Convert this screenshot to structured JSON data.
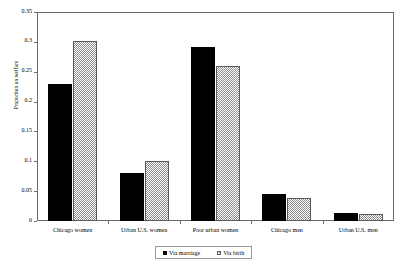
{
  "chart_data": {
    "type": "bar",
    "title": "",
    "xlabel": "",
    "ylabel": "Proportion on welfare",
    "categories": [
      "Chicago women",
      "Urban U.S. women",
      "Poor urban women",
      "Chicago men",
      "Urban U.S. men"
    ],
    "series": [
      {
        "name": "Via marriage",
        "color": "#000000",
        "pattern": "solid",
        "values": [
          0.23,
          0.08,
          0.291,
          0.045,
          0.013
        ]
      },
      {
        "name": "Via birth",
        "color": "#8d8d8d",
        "pattern": "checker",
        "values": [
          0.301,
          0.1,
          0.26,
          0.038,
          0.012
        ]
      }
    ],
    "ylim": [
      0,
      0.35
    ],
    "yticks": [
      0,
      0.05,
      0.1,
      0.15,
      0.2,
      0.25,
      0.3,
      0.35
    ],
    "ytick_labels": [
      "0",
      "0.05",
      "0.1",
      "0.15",
      "0.2",
      "0.25",
      "0.3",
      "0.35"
    ],
    "grid": false,
    "legend_position": "bottom-center"
  }
}
